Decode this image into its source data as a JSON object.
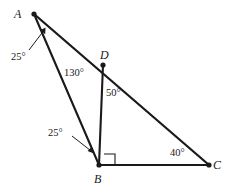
{
  "diagram": {
    "type": "geometry-triangle-figure",
    "stroke_color": "#1a1a1a",
    "background_color": "#ffffff",
    "vertices": [
      {
        "name": "A",
        "label": "A",
        "x": 34,
        "y": 14,
        "label_x": 14,
        "label_y": 8,
        "dot": true
      },
      {
        "name": "B",
        "label": "B",
        "x": 99,
        "y": 165,
        "label_x": 94,
        "label_y": 173,
        "dot": true
      },
      {
        "name": "C",
        "label": "C",
        "x": 209,
        "y": 165,
        "label_x": 213,
        "label_y": 159,
        "dot": true
      },
      {
        "name": "D",
        "label": "D",
        "x": 103,
        "y": 65,
        "label_x": 100,
        "label_y": 49,
        "dot": true
      }
    ],
    "segments": [
      {
        "name": "segment-AC",
        "from": "A",
        "to": "C"
      },
      {
        "name": "segment-AB",
        "from": "A",
        "to": "B"
      },
      {
        "name": "segment-DB",
        "from": "D",
        "to": "B"
      },
      {
        "name": "segment-BC",
        "from": "B",
        "to": "C"
      }
    ],
    "right_angle": {
      "at": "B",
      "between": [
        "segment-DB",
        "segment-BC"
      ],
      "marker": "square"
    },
    "angle_labels": [
      {
        "name": "angle-at-A",
        "value": "25°",
        "vertex": "A",
        "has_leader": true,
        "leader_from_x": 29,
        "leader_from_y": 50,
        "leader_to_x": 44,
        "leader_to_y": 30
      },
      {
        "name": "angle-ABD",
        "value": "25°",
        "vertex": "B",
        "has_leader": true,
        "leader_from_x": 72,
        "leader_from_y": 136,
        "leader_to_x": 92,
        "leader_to_y": 152
      },
      {
        "name": "angle-ADB",
        "value": "130°",
        "vertex": "D",
        "has_leader": false
      },
      {
        "name": "angle-BDC",
        "value": "50°",
        "vertex": "D",
        "has_leader": false
      },
      {
        "name": "angle-at-C",
        "value": "40°",
        "vertex": "C",
        "has_leader": false
      }
    ]
  }
}
